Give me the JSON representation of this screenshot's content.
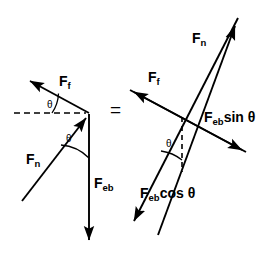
{
  "figure": {
    "background_color": "#ffffff",
    "stroke_color": "#000000",
    "width": 271,
    "height": 271,
    "equals_sign": "="
  },
  "left_diagram": {
    "name": "resultant-force-diagram",
    "labels": {
      "friction": {
        "symbol": "F",
        "subscript": "f"
      },
      "normal": {
        "symbol": "F",
        "subscript": "n"
      },
      "elastic_band": {
        "symbol": "F",
        "subscript": "eb"
      },
      "angle_top": "θ",
      "angle_lower": "θ"
    },
    "vectors": [
      {
        "name": "friction-vector",
        "label": "F_f",
        "from": [
          89,
          113
        ],
        "to": [
          27,
          79
        ],
        "arrow": true
      },
      {
        "name": "normal-force-vector",
        "label": "F_n",
        "from": [
          22,
          201
        ],
        "to": [
          89,
          114
        ],
        "arrow": true
      },
      {
        "name": "elastic-band-vector",
        "label": "F_eb",
        "from": [
          89,
          114
        ],
        "to": [
          89,
          246
        ],
        "arrow": true
      },
      {
        "name": "horizontal-dashed-reference",
        "label": "",
        "from": [
          14,
          113
        ],
        "to": [
          88,
          113
        ],
        "arrow": false,
        "dashed": true
      }
    ]
  },
  "right_diagram": {
    "name": "component-force-diagram",
    "labels": {
      "normal": {
        "symbol": "F",
        "subscript": "n"
      },
      "friction": {
        "symbol": "F",
        "subscript": "f"
      },
      "eb_sin": {
        "symbol": "F",
        "subscript": "eb",
        "trig": "sin θ"
      },
      "eb_cos": {
        "symbol": "F",
        "subscript": "eb",
        "trig": "cos θ"
      },
      "angle": "θ"
    },
    "vectors": [
      {
        "name": "normal-force-vector",
        "label": "F_n",
        "from": [
          158,
          235
        ],
        "to": [
          238,
          18
        ],
        "arrow": true
      },
      {
        "name": "friction-vector",
        "label": "F_f",
        "from": [
          246,
          152
        ],
        "to": [
          130,
          90
        ],
        "arrow": true
      },
      {
        "name": "eb-sin-component-vector",
        "label": "F_eb sin θ",
        "from": [
          130,
          90
        ],
        "to": [
          246,
          152
        ],
        "arrow": true
      },
      {
        "name": "eb-cos-component-vector",
        "label": "F_eb cos θ",
        "from": [
          238,
          18
        ],
        "to": [
          130,
          228
        ],
        "arrow": true
      },
      {
        "name": "vertical-dashed-reference",
        "label": "",
        "from": [
          182,
          117
        ],
        "to": [
          182,
          172
        ],
        "arrow": false,
        "dashed": true
      }
    ]
  }
}
